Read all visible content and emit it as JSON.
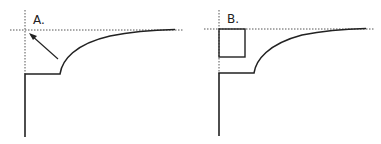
{
  "panels": [
    {
      "id": "A",
      "label": "A.",
      "annotation": "arrow from curve kink toward asymptote/axis intersection"
    },
    {
      "id": "B",
      "label": "B.",
      "annotation": "square drawn between asymptote and step level at axis"
    }
  ],
  "colors": {
    "line": "#222222",
    "dotted": "#555555",
    "background": "#ffffff"
  }
}
